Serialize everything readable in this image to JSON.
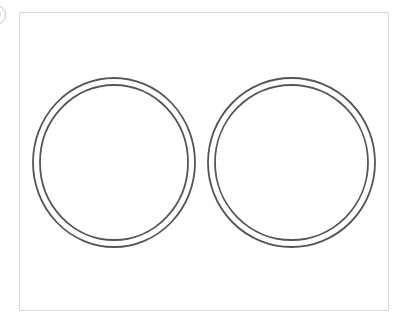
{
  "diagram": {
    "type": "double-ring-pair",
    "frame": {
      "x": 19,
      "y": 12,
      "width": 370,
      "height": 299,
      "border_color": "#d9d9d9"
    },
    "stroke_color": "#555555",
    "stroke_width": 1.8,
    "rings": [
      {
        "name": "left-ring",
        "cx": 114,
        "cy": 162.5,
        "outer": {
          "rx": 81,
          "ry": 84.5
        },
        "inner": {
          "rx": 74,
          "ry": 77.5
        }
      },
      {
        "name": "right-ring",
        "cx": 291.5,
        "cy": 162.5,
        "outer": {
          "rx": 83.5,
          "ry": 84.5
        },
        "inner": {
          "rx": 76.5,
          "ry": 77.5
        }
      }
    ]
  },
  "corner_badge": {
    "icon": "circle-badge-icon",
    "visible": "partial"
  }
}
